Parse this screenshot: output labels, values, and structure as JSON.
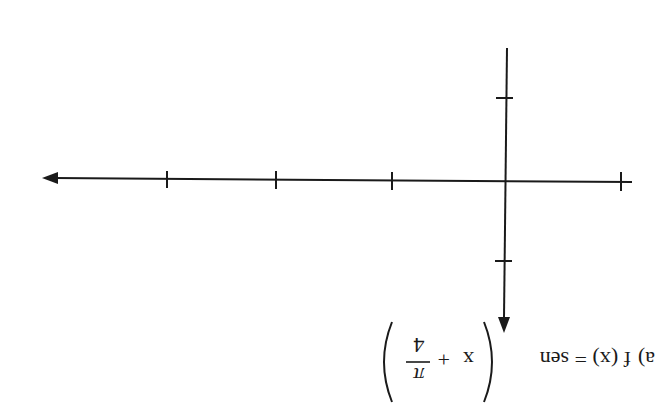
{
  "exercise": {
    "label": "a)",
    "function_lhs": "f (x) = sen",
    "argument_var": "x",
    "argument_op": "+",
    "fraction_numerator": "π",
    "fraction_denominator": "4",
    "orientation_note": "rotated 180°"
  },
  "axes": {
    "x_axis": {
      "arrow_direction_on_screen": "left",
      "tick_count": 4
    },
    "y_axis": {
      "arrow_direction_on_screen": "down",
      "tick_count": 2
    },
    "color": "#1a1a1a"
  }
}
